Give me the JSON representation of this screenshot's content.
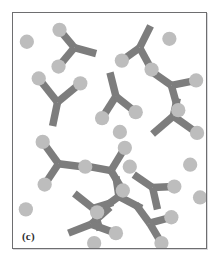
{
  "figure": {
    "panel_label": "(c)",
    "caption_text": "(c)",
    "background_color": "#ffffff",
    "frame_color": "#6e6e70",
    "frame_shadow_color": "#d9d9dc",
    "antibody_color": "#7d7d7d",
    "antigen_color": "#bdbdbd",
    "viewbox": "0 0 195 237",
    "antibody_arm_width": 7.5,
    "antigen_radius": 7.2,
    "counts": {
      "antibodies": 13,
      "antigens": 29
    },
    "antibodies": [
      {
        "name": "antibody-1",
        "hinge": [
          62,
          35
        ],
        "stem_end": [
          84,
          41
        ],
        "arm_a_end": [
          47,
          17
        ],
        "arm_b_end": [
          46,
          54
        ]
      },
      {
        "name": "antibody-2",
        "hinge": [
          128,
          35
        ],
        "stem_end": [
          139,
          13
        ],
        "arm_a_end": [
          110,
          48
        ],
        "arm_b_end": [
          140,
          57
        ]
      },
      {
        "name": "antibody-3",
        "hinge": [
          45,
          90
        ],
        "stem_end": [
          40,
          114
        ],
        "arm_a_end": [
          26,
          66
        ],
        "arm_b_end": [
          68,
          71
        ]
      },
      {
        "name": "antibody-4",
        "hinge": [
          104,
          84
        ],
        "stem_end": [
          98,
          60
        ],
        "arm_a_end": [
          90,
          106
        ],
        "arm_b_end": [
          124,
          100
        ]
      },
      {
        "name": "antibody-5",
        "hinge": [
          160,
          73
        ],
        "stem_end": [
          140,
          59
        ],
        "arm_a_end": [
          185,
          68
        ],
        "arm_b_end": [
          167,
          98
        ]
      },
      {
        "name": "antibody-6",
        "hinge": [
          162,
          104
        ],
        "stem_end": [
          166,
          86
        ],
        "arm_a_end": [
          141,
          122
        ],
        "arm_b_end": [
          186,
          121
        ]
      },
      {
        "name": "antibody-7",
        "hinge": [
          46,
          152
        ],
        "stem_end": [
          70,
          155
        ],
        "arm_a_end": [
          30,
          130
        ],
        "arm_b_end": [
          32,
          173
        ]
      },
      {
        "name": "antibody-8",
        "hinge": [
          99,
          159
        ],
        "stem_end": [
          77,
          155
        ],
        "arm_a_end": [
          113,
          136
        ],
        "arm_b_end": [
          111,
          179
        ]
      },
      {
        "name": "antibody-9",
        "hinge": [
          107,
          185
        ],
        "stem_end": [
          104,
          165
        ],
        "arm_a_end": [
          85,
          201
        ],
        "arm_b_end": [
          130,
          197
        ]
      },
      {
        "name": "antibody-10",
        "hinge": [
          81,
          197
        ],
        "stem_end": [
          62,
          182
        ],
        "arm_a_end": [
          101,
          191
        ],
        "arm_b_end": [
          88,
          219
        ]
      },
      {
        "name": "antibody-11",
        "hinge": [
          79,
          213
        ],
        "stem_end": [
          56,
          222
        ],
        "arm_a_end": [
          98,
          196
        ],
        "arm_b_end": [
          104,
          222
        ]
      },
      {
        "name": "antibody-12",
        "hinge": [
          141,
          176
        ],
        "stem_end": [
          122,
          163
        ],
        "arm_a_end": [
          163,
          175
        ],
        "arm_b_end": [
          146,
          198
        ]
      },
      {
        "name": "antibody-13",
        "hinge": [
          138,
          212
        ],
        "stem_end": [
          124,
          193
        ],
        "arm_a_end": [
          160,
          206
        ],
        "arm_b_end": [
          150,
          232
        ]
      }
    ],
    "antigens": [
      {
        "name": "antigen-1",
        "cx": 47,
        "cy": 17
      },
      {
        "name": "antigen-2",
        "cx": 46,
        "cy": 54
      },
      {
        "name": "antigen-3",
        "cx": 110,
        "cy": 48
      },
      {
        "name": "antigen-4",
        "cx": 140,
        "cy": 57
      },
      {
        "name": "antigen-5",
        "cx": 26,
        "cy": 66
      },
      {
        "name": "antigen-6",
        "cx": 68,
        "cy": 71
      },
      {
        "name": "antigen-7",
        "cx": 90,
        "cy": 106
      },
      {
        "name": "antigen-8",
        "cx": 124,
        "cy": 100
      },
      {
        "name": "antigen-9",
        "cx": 185,
        "cy": 68
      },
      {
        "name": "antigen-10",
        "cx": 167,
        "cy": 98
      },
      {
        "name": "antigen-11",
        "cx": 186,
        "cy": 121
      },
      {
        "name": "antigen-12",
        "cx": 30,
        "cy": 130
      },
      {
        "name": "antigen-13",
        "cx": 32,
        "cy": 173
      },
      {
        "name": "antigen-14",
        "cx": 73,
        "cy": 155
      },
      {
        "name": "antigen-15",
        "cx": 113,
        "cy": 136
      },
      {
        "name": "antigen-16",
        "cx": 111,
        "cy": 179
      },
      {
        "name": "antigen-17",
        "cx": 85,
        "cy": 201
      },
      {
        "name": "antigen-18",
        "cx": 104,
        "cy": 222
      },
      {
        "name": "antigen-19",
        "cx": 163,
        "cy": 175
      },
      {
        "name": "antigen-20",
        "cx": 160,
        "cy": 206
      },
      {
        "name": "antigen-21",
        "cx": 150,
        "cy": 232
      },
      {
        "name": "antigen-22",
        "cx": 14,
        "cy": 29
      },
      {
        "name": "antigen-23",
        "cx": 158,
        "cy": 26
      },
      {
        "name": "antigen-24",
        "cx": 108,
        "cy": 120
      },
      {
        "name": "antigen-25",
        "cx": 179,
        "cy": 153
      },
      {
        "name": "antigen-26",
        "cx": 13,
        "cy": 198
      },
      {
        "name": "antigen-27",
        "cx": 82,
        "cy": 232
      },
      {
        "name": "antigen-28",
        "cx": 118,
        "cy": 155
      },
      {
        "name": "antigen-29",
        "cx": 189,
        "cy": 186
      }
    ]
  }
}
